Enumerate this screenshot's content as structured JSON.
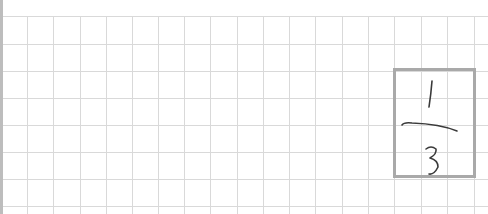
{
  "canvas": {
    "kind": "graph-paper",
    "grid_color": "#d9d9d9",
    "box_color": "#a9a9a9",
    "ink_color": "#3a3a3a"
  },
  "handwriting": {
    "content": "1/3",
    "numerator": "1",
    "denominator": "3",
    "type": "fraction"
  }
}
